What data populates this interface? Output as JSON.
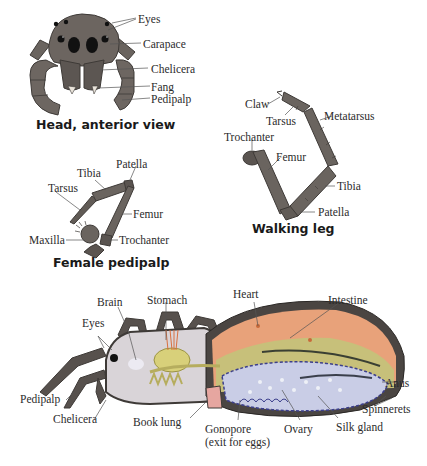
{
  "figures": {
    "head": {
      "caption": "Head, anterior view",
      "labels": {
        "eyes": "Eyes",
        "carapace": "Carapace",
        "chelicera": "Chelicera",
        "fang": "Fang",
        "pedipalp": "Pedipalp"
      }
    },
    "walking_leg": {
      "caption": "Walking leg",
      "labels": {
        "claw": "Claw",
        "tarsus": "Tarsus",
        "metatarsus": "Metatarsus",
        "trochanter": "Trochanter",
        "femur": "Femur",
        "tibia": "Tibia",
        "patella": "Patella"
      }
    },
    "female_pedipalp": {
      "caption": "Female pedipalp",
      "labels": {
        "tibia": "Tibia",
        "patella": "Patella",
        "tarsus": "Tarsus",
        "femur": "Femur",
        "maxilla": "Maxilla",
        "trochanter": "Trochanter"
      }
    },
    "body_section": {
      "labels": {
        "brain": "Brain",
        "stomach": "Stomach",
        "heart": "Heart",
        "intestine": "Intestine",
        "eyes": "Eyes",
        "pedipalp": "Pedipalp",
        "chelicera": "Chelicera",
        "book_lung": "Book lung",
        "gonopore": "Gonopore",
        "gonopore_note": "(exit for eggs)",
        "ovary": "Ovary",
        "silk_gland": "Silk gland",
        "spinnerets": "Spinnerets",
        "anus": "Anus"
      }
    }
  },
  "colors": {
    "exoskeleton": "#5e5853",
    "exoskeleton_dark": "#3e3a37",
    "heart_orange": "#e8a27a",
    "intestine_green": "#b8b86a",
    "ovary_blue": "#c9cde6",
    "ovary_outline": "#3c3f8c",
    "cavity_gray": "#d7d3d6",
    "label_text": "#2b2b2b",
    "leader_line": "#555555"
  }
}
